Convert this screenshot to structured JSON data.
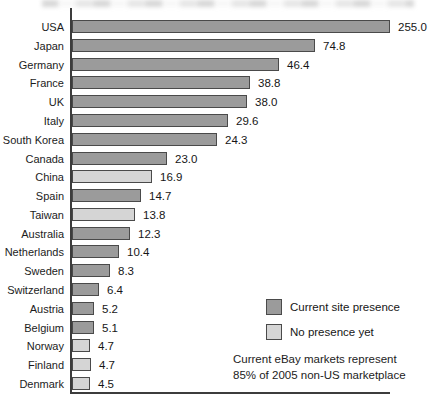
{
  "chart_data": {
    "type": "bar",
    "orientation": "horizontal",
    "grid": false,
    "categories": [
      "USA",
      "Japan",
      "Germany",
      "France",
      "UK",
      "Italy",
      "South Korea",
      "Canada",
      "China",
      "Spain",
      "Taiwan",
      "Australia",
      "Netherlands",
      "Sweden",
      "Switzerland",
      "Austria",
      "Belgium",
      "Norway",
      "Finland",
      "Denmark"
    ],
    "values": [
      255.0,
      74.8,
      46.4,
      38.8,
      38.0,
      29.6,
      24.3,
      23.0,
      16.9,
      14.7,
      13.8,
      12.3,
      10.4,
      8.3,
      6.4,
      5.2,
      5.1,
      4.7,
      4.7,
      4.5
    ],
    "presence": [
      "current",
      "current",
      "current",
      "current",
      "current",
      "current",
      "current",
      "current",
      "none",
      "current",
      "none",
      "current",
      "current",
      "current",
      "current",
      "current",
      "current",
      "none",
      "none",
      "none"
    ],
    "bar_px": [
      318,
      243,
      207,
      178,
      175,
      156,
      145,
      95,
      80,
      69,
      63,
      58,
      47,
      38,
      27,
      22,
      22,
      18,
      19,
      18
    ],
    "legend": [
      {
        "key": "current",
        "label": "Current site presence",
        "color": "#9b9b9b"
      },
      {
        "key": "none",
        "label": "No presence yet",
        "color": "#d5d5d5"
      }
    ],
    "note_lines": [
      "Current eBay markets represent",
      "85% of 2005 non-US marketplace"
    ],
    "colors": {
      "bar_current": "#9b9b9b",
      "bar_none": "#d5d5d5",
      "bar_border": "#4a4a4a",
      "axis": "#3c3c3c",
      "text": "#1c1c1c"
    },
    "layout": {
      "row_top_start": 20,
      "row_pitch": 18.79,
      "plot_left": 72,
      "value_gap": 8
    }
  }
}
